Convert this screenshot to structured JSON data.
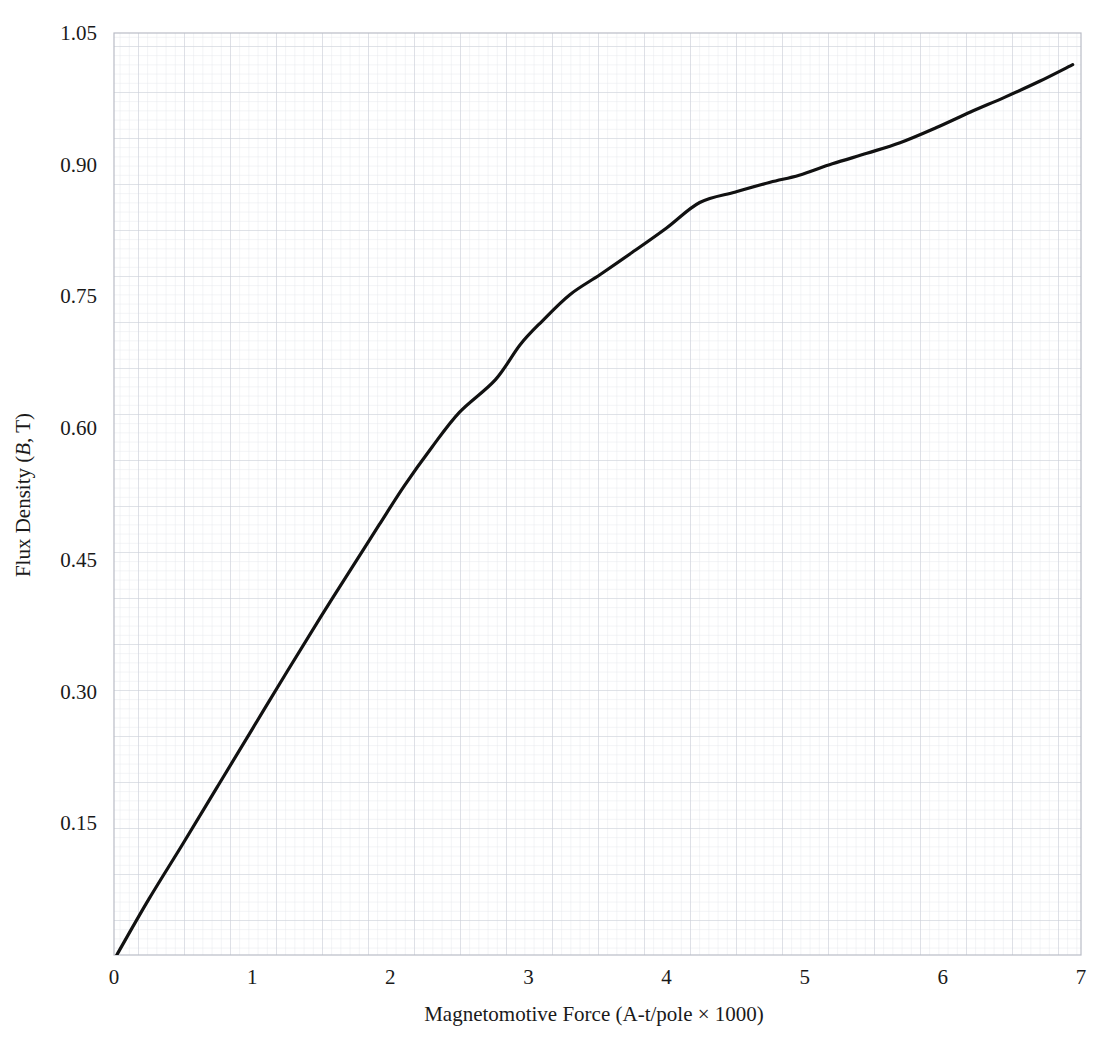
{
  "chart_data": {
    "type": "line",
    "title": "",
    "xlabel": "Magnetomotive Force (A-t/pole × 1000)",
    "ylabel_parts": {
      "prefix": "Flux Density (",
      "symbol": "B",
      "suffix": ", T)"
    },
    "ylabel": "Flux Density (B, T)",
    "xlim": [
      0,
      7
    ],
    "ylim": [
      0,
      1.05
    ],
    "xticks": [
      0,
      1,
      2,
      3,
      4,
      5,
      6,
      7
    ],
    "xtick_labels": [
      "0",
      "1",
      "2",
      "3",
      "4",
      "5",
      "6",
      "7"
    ],
    "yticks": [
      0.15,
      0.3,
      0.45,
      0.6,
      0.75,
      0.9,
      1.05
    ],
    "ytick_labels": [
      "0.15",
      "0.30",
      "0.45",
      "0.60",
      "0.75",
      "0.90",
      "1.05"
    ],
    "grid": "graph-paper-fine",
    "grid_minor_step_x": 0.0666,
    "grid_minor_step_y": 0.0105,
    "grid_major_every": 5,
    "legend": "none",
    "series": [
      {
        "name": "B-H magnetization curve",
        "color": "#111111",
        "line_width": 3.2,
        "x": [
          0.02,
          0.25,
          0.5,
          0.75,
          1.0,
          1.25,
          1.5,
          1.75,
          1.92,
          2.1,
          2.3,
          2.5,
          2.76,
          2.94,
          3.1,
          3.3,
          3.52,
          3.75,
          4.0,
          4.24,
          4.5,
          4.75,
          4.96,
          5.2,
          5.45,
          5.69,
          5.95,
          6.2,
          6.45,
          6.7,
          6.94
        ],
        "y": [
          0.0,
          0.063,
          0.127,
          0.192,
          0.257,
          0.322,
          0.386,
          0.448,
          0.49,
          0.534,
          0.578,
          0.618,
          0.655,
          0.695,
          0.722,
          0.752,
          0.775,
          0.8,
          0.828,
          0.857,
          0.869,
          0.88,
          0.888,
          0.901,
          0.913,
          0.925,
          0.942,
          0.96,
          0.977,
          0.995,
          1.014
        ]
      }
    ]
  },
  "colors": {
    "curve": "#111111",
    "grid_minor": "#e2e4ea",
    "grid_major": "#c9ccd6",
    "axis_frame": "#b9bcc6",
    "text": "#1a1a1a",
    "background": "#ffffff"
  },
  "plot_geometry": {
    "left_px": 114,
    "right_px": 1081,
    "top_px": 33,
    "bottom_px": 955
  }
}
